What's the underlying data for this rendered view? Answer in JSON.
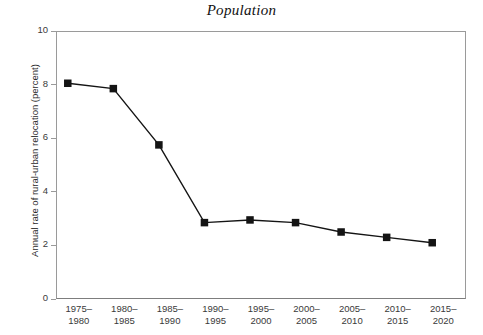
{
  "chart_data": {
    "type": "line",
    "title": "Population",
    "xlabel": "",
    "ylabel": "Annual rate of rural-urban relocation (percent)",
    "categories": [
      "1975–1980",
      "1980–1985",
      "1985–1990",
      "1990–1995",
      "1995–2000",
      "2000–2005",
      "2005–2010",
      "2010–2015",
      "2015–2020"
    ],
    "category_lines": [
      [
        "1975–",
        "1980"
      ],
      [
        "1980–",
        "1985"
      ],
      [
        "1985–",
        "1990"
      ],
      [
        "1990–",
        "1995"
      ],
      [
        "1995–",
        "2000"
      ],
      [
        "2000–",
        "2005"
      ],
      [
        "2005–",
        "2010"
      ],
      [
        "2010–",
        "2015"
      ],
      [
        "2015–",
        "2020"
      ]
    ],
    "values": [
      8.05,
      7.85,
      5.75,
      2.85,
      2.95,
      2.85,
      2.5,
      2.3,
      2.1
    ],
    "ylim": [
      0,
      10
    ],
    "yticks": [
      0,
      2,
      4,
      6,
      8,
      10
    ],
    "ytick_labels": [
      "0",
      "2",
      "4",
      "6",
      "8",
      "10"
    ],
    "grid": false,
    "legend": "none",
    "marker": "square",
    "series_color": "#141414",
    "axis_color": "#9a9a9a",
    "text_color": "#3a3a3a"
  }
}
